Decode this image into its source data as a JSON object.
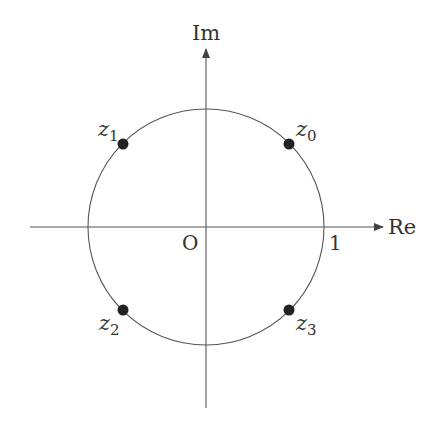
{
  "diagram": {
    "type": "complex-plane-unit-circle",
    "axes": {
      "real_label": "Re",
      "imag_label": "Im",
      "origin_label": "O",
      "unit_tick_label": "1"
    },
    "points": [
      {
        "name": "z",
        "subscript": "0",
        "angle_deg": 45
      },
      {
        "name": "z",
        "subscript": "1",
        "angle_deg": 135
      },
      {
        "name": "z",
        "subscript": "2",
        "angle_deg": 225
      },
      {
        "name": "z",
        "subscript": "3",
        "angle_deg": 315
      }
    ],
    "colors": {
      "line": "#555555",
      "point": "#222222",
      "text": "#333333"
    }
  }
}
